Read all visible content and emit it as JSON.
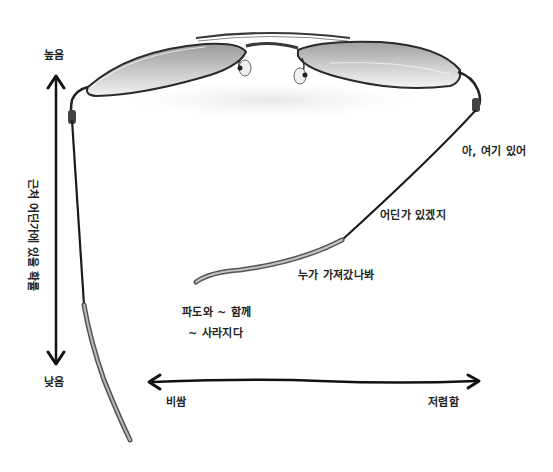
{
  "diagram": {
    "y_axis": {
      "label": "근처 어딘가에 있을 확률",
      "top": "높음",
      "bottom": "낮음"
    },
    "x_axis": {
      "left": "비쌈",
      "right": "저렴함"
    },
    "annotations": [
      {
        "text": "아, 여기 있어"
      },
      {
        "text": "어딘가 있겠지"
      },
      {
        "text": "누가 가져갔나봐"
      },
      {
        "text": "파도와 ~ 함께"
      },
      {
        "text": "~ 사라지다"
      }
    ],
    "colors": {
      "ink": "#1a1a1a",
      "frame": "#3a3a3a",
      "lens": "#b8b8b8",
      "background": "#ffffff"
    }
  }
}
